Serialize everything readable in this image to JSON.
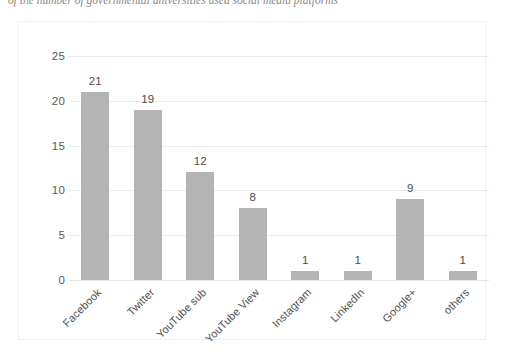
{
  "caption": {
    "text": "of the number of governmental universities used social media platforms"
  },
  "chart_data": {
    "type": "bar",
    "title": "",
    "xlabel": "",
    "ylabel": "",
    "categories": [
      "Facebook",
      "Twitter",
      "YouTube sub",
      "YouTube View",
      "Instagram",
      "LinkedIn",
      "Google+",
      "others"
    ],
    "values": [
      21,
      19,
      12,
      8,
      1,
      1,
      9,
      1
    ],
    "data_labels": [
      "21",
      "19",
      "12",
      "8",
      "1",
      "1",
      "9",
      "1"
    ],
    "ylim": [
      0,
      25
    ],
    "yticks": [
      0,
      5,
      10,
      15,
      20,
      25
    ],
    "ytick_labels": [
      "0",
      "5",
      "10",
      "15",
      "20",
      "25"
    ],
    "grid": true,
    "legend": false,
    "bar_color": "#b4b4b4",
    "gridline_color": "#e9ecef",
    "frame_color": "#eef1f4"
  }
}
